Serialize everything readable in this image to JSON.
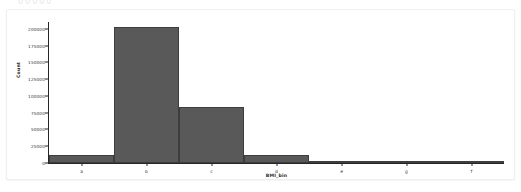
{
  "page": {
    "background_color": "#ffffff",
    "card_border_color": "#efefef",
    "clipped_text_above": "00000"
  },
  "chart_data": {
    "type": "bar",
    "title": "",
    "subtitle": "",
    "xlabel": "BMI_bin",
    "ylabel": "Count",
    "categories": [
      "a",
      "b",
      "c",
      "d",
      "e",
      "g",
      "f"
    ],
    "values": [
      12000,
      202000,
      84000,
      12500,
      2000,
      0,
      500
    ],
    "series": [
      {
        "name": "Count",
        "values": [
          12000,
          202000,
          84000,
          12500,
          2000,
          0,
          500
        ]
      }
    ],
    "ylim": [
      0,
      210000
    ],
    "xlim": [
      0,
      7
    ],
    "ytick_labels": [
      "0",
      "25000",
      "50000",
      "75000",
      "100000",
      "125000",
      "150000",
      "175000",
      "200000"
    ],
    "ytick_values": [
      0,
      25000,
      50000,
      75000,
      100000,
      125000,
      150000,
      175000,
      200000
    ],
    "xtick_labels": [
      "a",
      "b",
      "c",
      "d",
      "e",
      "g",
      "f"
    ],
    "grid": false,
    "legend": false,
    "legend_position": "none",
    "bar_color": "#595959",
    "bar_edge_color": "#3d3d3d",
    "axis_color": "#262626",
    "plot_background": "#ffffff"
  }
}
